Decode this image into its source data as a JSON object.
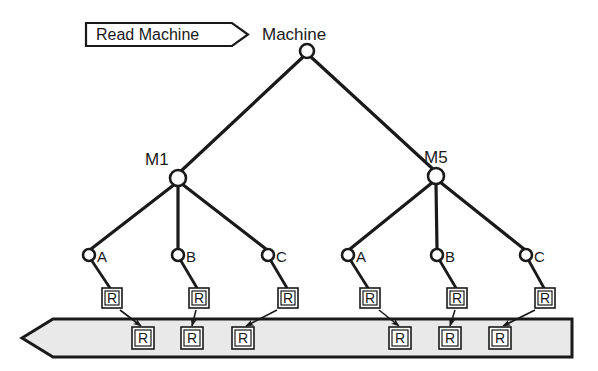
{
  "diagram": {
    "title": "Read Machine",
    "tag": {
      "label": "Read Machine",
      "shape": "arrow-tag",
      "x": 85,
      "y": 22,
      "w": 163,
      "h": 24
    },
    "root": {
      "label": "Machine",
      "label_x": 307,
      "label_y": 33,
      "cx": 307,
      "cy": 51,
      "r": 7
    },
    "mid_nodes": [
      {
        "label": "M1",
        "label_x": 158,
        "label_y": 160,
        "cx": 178,
        "cy": 178,
        "r": 8
      },
      {
        "label": "M5",
        "label_x": 440,
        "label_y": 158,
        "cx": 436,
        "cy": 176,
        "r": 8
      }
    ],
    "leaves": [
      {
        "label": "A",
        "group": "M1",
        "cx": 89,
        "cy": 255,
        "r": 6,
        "label_x": 100,
        "label_y": 262,
        "rbox_x": 112,
        "rbox_y": 297,
        "tape_x": 143
      },
      {
        "label": "B",
        "group": "M1",
        "cx": 178,
        "cy": 255,
        "r": 6,
        "label_x": 189,
        "label_y": 262,
        "rbox_x": 199,
        "rbox_y": 297,
        "tape_x": 192
      },
      {
        "label": "C",
        "group": "M1",
        "cx": 268,
        "cy": 255,
        "r": 6,
        "label_x": 279,
        "label_y": 262,
        "rbox_x": 288,
        "rbox_y": 297,
        "tape_x": 243
      },
      {
        "label": "A",
        "group": "M5",
        "cx": 348,
        "cy": 255,
        "r": 6,
        "label_x": 359,
        "label_y": 262,
        "rbox_x": 370,
        "rbox_y": 297,
        "tape_x": 400
      },
      {
        "label": "B",
        "group": "M5",
        "cx": 437,
        "cy": 255,
        "r": 6,
        "label_x": 448,
        "label_y": 262,
        "rbox_x": 457,
        "rbox_y": 297,
        "tape_x": 450
      },
      {
        "label": "C",
        "group": "M5",
        "cx": 526,
        "cy": 255,
        "r": 6,
        "label_x": 537,
        "label_y": 262,
        "rbox_x": 545,
        "rbox_y": 297,
        "tape_x": 500
      }
    ],
    "register_label": "R",
    "tape": {
      "left_tip_x": 22,
      "body_left_x": 52,
      "right_x": 572,
      "top_y": 318,
      "bottom_y": 358,
      "fill": "#e9e9e9",
      "stroke": "#1a1a1a"
    },
    "tape_cells": [
      {
        "label": "R",
        "cx": 143,
        "cy": 338
      },
      {
        "label": "R",
        "cx": 192,
        "cy": 338
      },
      {
        "label": "R",
        "cx": 243,
        "cy": 338
      },
      {
        "label": "R",
        "cx": 400,
        "cy": 338
      },
      {
        "label": "R",
        "cx": 450,
        "cy": 338
      },
      {
        "label": "R",
        "cx": 500,
        "cy": 338
      }
    ],
    "colors": {
      "background": "#ffffff",
      "stroke": "#1a1a1a",
      "tape_fill": "#e9e9e9",
      "node_fill": "#ffffff"
    }
  }
}
